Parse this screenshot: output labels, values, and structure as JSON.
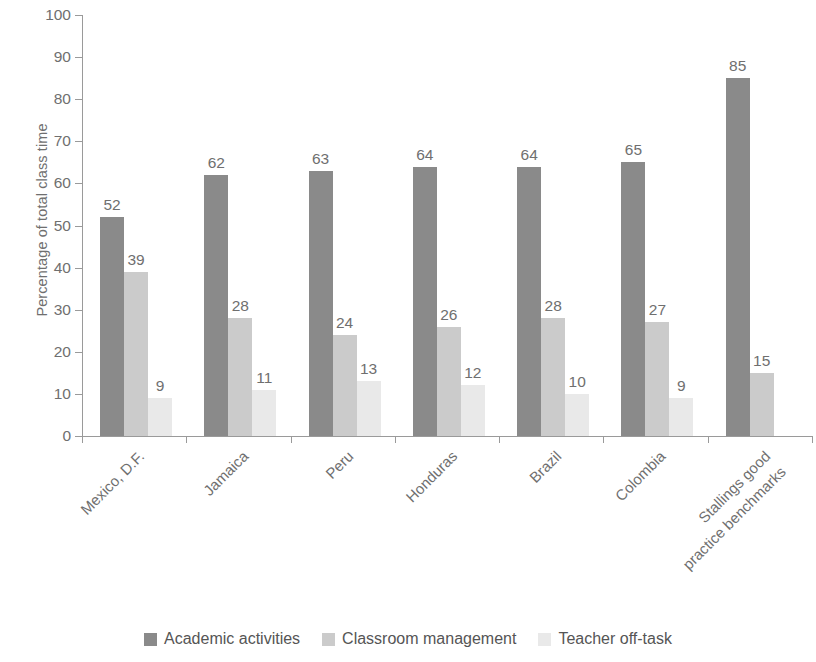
{
  "chart_data": {
    "type": "bar",
    "title": "",
    "subtitle": "",
    "xlabel": "",
    "ylabel": "Percentage of total class time",
    "ylim": [
      0,
      100
    ],
    "ytick_step": 10,
    "ytick_labels": [
      "0",
      "10",
      "20",
      "30",
      "40",
      "50",
      "60",
      "70",
      "80",
      "90",
      "100"
    ],
    "grid": false,
    "legend_position": "bottom",
    "orientation": "vertical",
    "grouped": true,
    "categories": [
      "Mexico, D.F.",
      "Jamaica",
      "Peru",
      "Honduras",
      "Brazil",
      "Colombia",
      "Stallings good practice benchmarks"
    ],
    "category_lines": [
      [
        "Mexico, D.F."
      ],
      [
        "Jamaica"
      ],
      [
        "Peru"
      ],
      [
        "Honduras"
      ],
      [
        "Brazil"
      ],
      [
        "Colombia"
      ],
      [
        "Stallings good",
        "practice benchmarks"
      ]
    ],
    "series": [
      {
        "name": "Academic activities",
        "color": "#8a8a8a",
        "values": [
          52,
          62,
          63,
          64,
          64,
          65,
          85
        ]
      },
      {
        "name": "Classroom management",
        "color": "#cbcbcb",
        "values": [
          39,
          28,
          24,
          26,
          28,
          27,
          15
        ]
      },
      {
        "name": "Teacher off-task",
        "color": "#e9e9e9",
        "values": [
          9,
          11,
          13,
          12,
          10,
          9,
          null
        ]
      }
    ]
  }
}
